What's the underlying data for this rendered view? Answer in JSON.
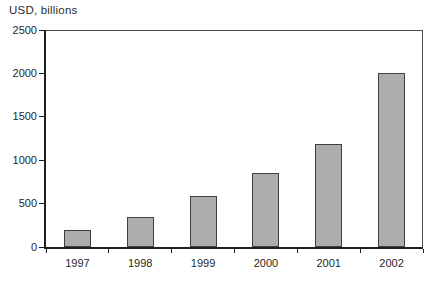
{
  "chart_data": {
    "type": "bar",
    "title": "",
    "ylabel": "USD, billions",
    "xlabel": "",
    "categories": [
      "1997",
      "1998",
      "1999",
      "2000",
      "2001",
      "2002"
    ],
    "values": [
      200,
      350,
      590,
      850,
      1190,
      2000
    ],
    "ylim": [
      0,
      2500
    ],
    "yticks": [
      0,
      500,
      1000,
      1500,
      2000,
      2500
    ],
    "grid": false,
    "legend": "none",
    "colors": {
      "bar_fill": "#adadad",
      "bar_border": "#3f3f3f",
      "axis": "#1f1f1f",
      "frame": "#4d4d4d",
      "text": "#1f1f1f",
      "background": "#ffffff"
    }
  }
}
